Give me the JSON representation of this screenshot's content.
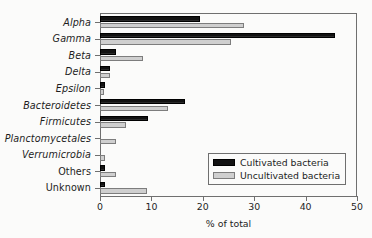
{
  "chart_data": {
    "type": "bar",
    "orientation": "horizontal",
    "title": "",
    "xlabel": "% of total",
    "ylabel": "",
    "xlim": [
      0,
      50
    ],
    "xticks": [
      0,
      10,
      20,
      30,
      40,
      50
    ],
    "xtick_labels": [
      "0",
      "10",
      "20",
      "30",
      "40",
      "50"
    ],
    "grid": false,
    "legend_position": "lower-right",
    "categories": [
      "Alpha",
      "Gamma",
      "Beta",
      "Delta",
      "Epsilon",
      "Bacteroidetes",
      "Firmicutes",
      "Planctomycetales",
      "Verrumicrobia",
      "Others",
      "Unknown"
    ],
    "category_styles": [
      "italic",
      "italic",
      "italic",
      "italic",
      "italic",
      "italic",
      "italic",
      "italic",
      "italic",
      "upright",
      "upright"
    ],
    "series": [
      {
        "name": "Cultivated bacteria",
        "color": "#121212",
        "values": [
          19.4,
          45.8,
          3.2,
          2.0,
          1.0,
          16.6,
          9.3,
          0.0,
          0.0,
          1.0,
          1.0
        ]
      },
      {
        "name": "Uncultivated bacteria",
        "color": "#cfcfcf",
        "values": [
          28.0,
          25.4,
          8.3,
          1.9,
          0.8,
          13.2,
          5.0,
          3.1,
          0.9,
          3.1,
          9.2
        ]
      }
    ]
  },
  "legend": {
    "items": [
      {
        "label": "Cultivated bacteria",
        "swatch": "black-filled-swatch"
      },
      {
        "label": "Uncultivated bacteria",
        "swatch": "gray-outlined-swatch"
      }
    ]
  }
}
